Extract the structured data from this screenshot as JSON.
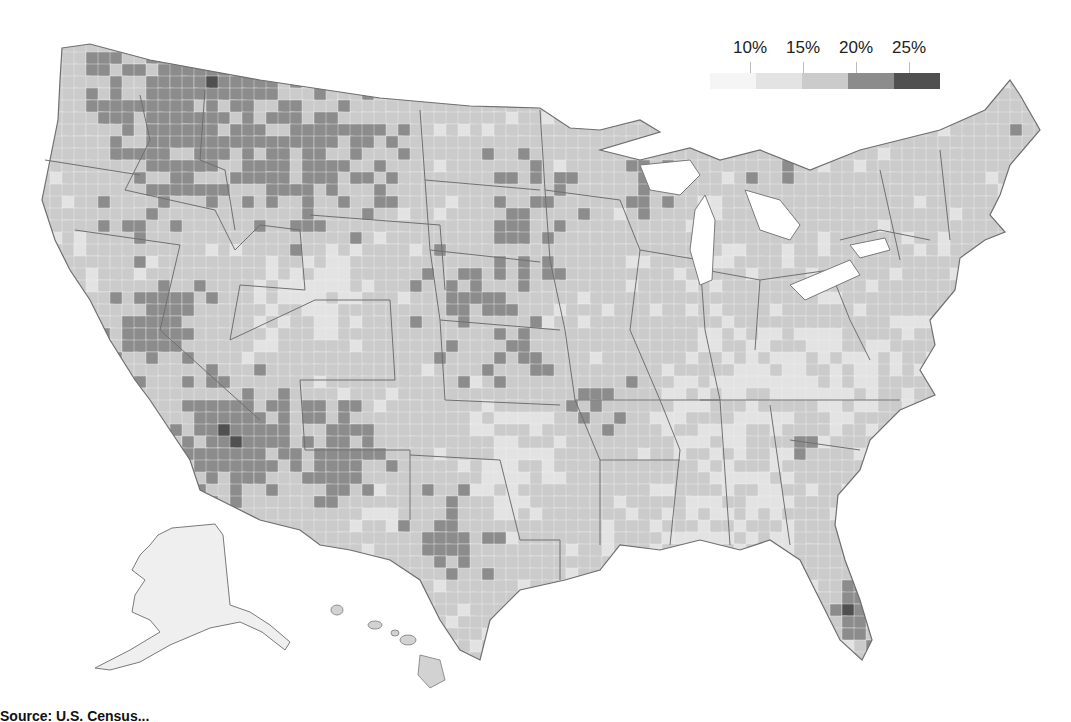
{
  "chart_data": {
    "type": "choropleth",
    "title": "",
    "region": "United States (by county)",
    "legend": {
      "position": "top-right",
      "tick_labels": [
        "10%",
        "15%",
        "20%",
        "25%"
      ],
      "bins": [
        {
          "range": "<10%",
          "color": "#f5f5f5"
        },
        {
          "range": "10%–15%",
          "color": "#e3e3e3"
        },
        {
          "range": "15%–20%",
          "color": "#cbcbcb"
        },
        {
          "range": "20%–25%",
          "color": "#8c8c8c"
        },
        {
          "range": ">25%",
          "color": "#505050"
        }
      ]
    },
    "notable_high_regions": [
      "Southern Nevada / Western Arizona",
      "Northern Idaho / Montana",
      "Central Great Plains",
      "Northern Michigan",
      "Florida Gulf Coast",
      "South Texas Hill Country",
      "Arkansas / Missouri Ozarks",
      "New Mexico"
    ],
    "grid": false,
    "insets": [
      "Alaska",
      "Hawaii"
    ]
  },
  "legend": {
    "labels": [
      "10%",
      "15%",
      "20%",
      "25%"
    ]
  },
  "colors": {
    "bin0": "#f5f5f5",
    "bin1": "#e3e3e3",
    "bin2": "#cbcbcb",
    "bin3": "#8c8c8c",
    "bin4": "#505050",
    "border": "#7a7a7a"
  },
  "source": {
    "text": "Source: U.S. Census..."
  }
}
